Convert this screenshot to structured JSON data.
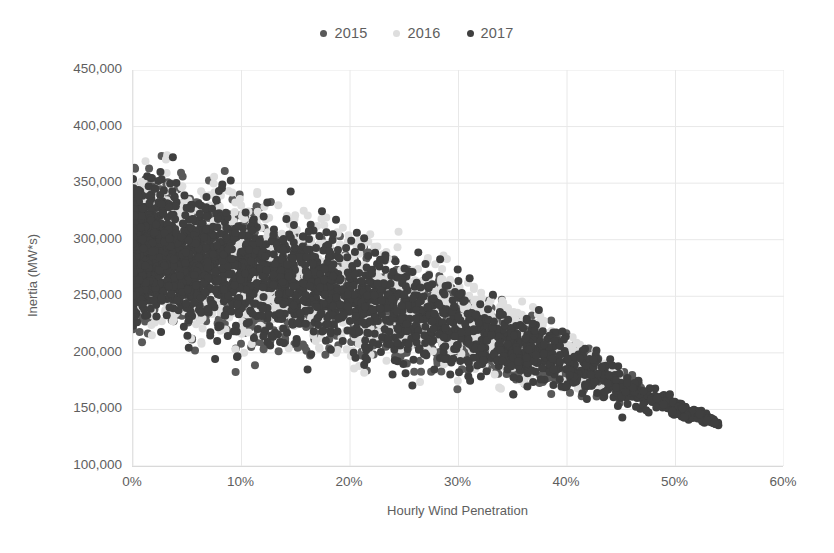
{
  "chart_data": {
    "type": "scatter",
    "title": "",
    "xlabel": "Hourly Wind Penetration",
    "ylabel": "Inertia (MW*s)",
    "xlim": [
      0,
      60
    ],
    "ylim": [
      100000,
      450000
    ],
    "x_tick_labels": [
      "0%",
      "10%",
      "20%",
      "30%",
      "40%",
      "50%",
      "60%"
    ],
    "x_tick_values": [
      0,
      10,
      20,
      30,
      40,
      50,
      60
    ],
    "y_tick_labels": [
      "100,000",
      "150,000",
      "200,000",
      "250,000",
      "300,000",
      "350,000",
      "400,000",
      "450,000"
    ],
    "y_tick_values": [
      100000,
      150000,
      200000,
      250000,
      300000,
      350000,
      400000,
      450000
    ],
    "grid": true,
    "legend_position": "top-center",
    "marker_size": 4.0,
    "series": [
      {
        "name": "2015",
        "color": "#595959",
        "n_points": 2900,
        "x_range": [
          0.0,
          47.0
        ],
        "y_range": [
          148000,
          392000
        ],
        "density": "dense-left-wall",
        "upper_envelope": [
          [
            0,
            380000
          ],
          [
            2,
            392000
          ],
          [
            6,
            380000
          ],
          [
            12,
            362000
          ],
          [
            20,
            335000
          ],
          [
            28,
            300000
          ],
          [
            36,
            258000
          ],
          [
            44,
            205000
          ],
          [
            47,
            178000
          ]
        ],
        "lower_envelope": [
          [
            0,
            200000
          ],
          [
            4,
            186000
          ],
          [
            10,
            172000
          ],
          [
            18,
            160000
          ],
          [
            26,
            155000
          ],
          [
            34,
            150000
          ],
          [
            42,
            148000
          ],
          [
            47,
            150000
          ]
        ]
      },
      {
        "name": "2016",
        "color": "#dedede",
        "n_points": 2750,
        "x_range": [
          0.0,
          45.0
        ],
        "y_range": [
          150000,
          388000
        ],
        "density": "dense-left-wall",
        "upper_envelope": [
          [
            0,
            378000
          ],
          [
            3,
            388000
          ],
          [
            8,
            378000
          ],
          [
            14,
            366000
          ],
          [
            22,
            340000
          ],
          [
            30,
            302000
          ],
          [
            38,
            252000
          ],
          [
            45,
            196000
          ]
        ],
        "lower_envelope": [
          [
            0,
            204000
          ],
          [
            5,
            190000
          ],
          [
            12,
            175000
          ],
          [
            20,
            165000
          ],
          [
            28,
            158000
          ],
          [
            36,
            153000
          ],
          [
            45,
            152000
          ]
        ]
      },
      {
        "name": "2017",
        "color": "#3f3f3f",
        "n_points": 3050,
        "x_range": [
          0.0,
          54.0
        ],
        "y_range": [
          133000,
          390000
        ],
        "density": "dense-left-wall",
        "upper_envelope": [
          [
            0,
            374000
          ],
          [
            2,
            390000
          ],
          [
            7,
            376000
          ],
          [
            15,
            356000
          ],
          [
            23,
            326000
          ],
          [
            31,
            288000
          ],
          [
            39,
            240000
          ],
          [
            47,
            186000
          ],
          [
            54,
            142000
          ]
        ],
        "lower_envelope": [
          [
            0,
            198000
          ],
          [
            6,
            182000
          ],
          [
            14,
            168000
          ],
          [
            22,
            158000
          ],
          [
            30,
            151000
          ],
          [
            38,
            146000
          ],
          [
            46,
            141000
          ],
          [
            54,
            133000
          ]
        ]
      }
    ],
    "outlier_points": [
      {
        "x": 48.3,
        "y": 160000,
        "series": "2017"
      },
      {
        "x": 49.7,
        "y": 148000,
        "series": "2017"
      },
      {
        "x": 50.8,
        "y": 143000,
        "series": "2017"
      },
      {
        "x": 52.2,
        "y": 146000,
        "series": "2017"
      },
      {
        "x": 52.9,
        "y": 140000,
        "series": "2017"
      },
      {
        "x": 53.6,
        "y": 138000,
        "series": "2017"
      }
    ],
    "annotation": "Inertia decreases approximately linearly as hourly wind penetration increases; maximum penetration reaches ~54%."
  },
  "legend": {
    "items": [
      {
        "label": "2015",
        "color": "#595959",
        "marker": "circle-marker"
      },
      {
        "label": "2016",
        "color": "#dedede",
        "marker": "circle-marker"
      },
      {
        "label": "2017",
        "color": "#3f3f3f",
        "marker": "circle-marker"
      }
    ]
  },
  "colors": {
    "background": "#ffffff",
    "gridline": "#e8e8e8",
    "axis_line": "#d9d9d9",
    "text": "#5e5e5e"
  }
}
